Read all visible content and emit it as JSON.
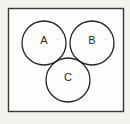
{
  "figure": {
    "kind": "venn-diagram",
    "background_color": "#f3f2ef",
    "frame": {
      "name": "diagram-border-frame",
      "stroke_color": "#3a3a3a",
      "x": 8,
      "y": 8,
      "width": 116,
      "height": 104
    },
    "corner_mark": {
      "name": "scan-artifact-mark",
      "color": "#1d1d1d",
      "x": 0,
      "y": 2,
      "width": 5,
      "height": 5
    },
    "stroke_color": "#262626",
    "stroke_width": 1.3,
    "fill_unshaded": "#fdfdfb",
    "fill_shaded": "#7b7b7b",
    "sets": [
      {
        "id": "A",
        "label": "A",
        "cx": 44,
        "cy": 43,
        "r": 22,
        "label_x": 44,
        "label_y": 41
      },
      {
        "id": "B",
        "label": "B",
        "cx": 92,
        "cy": 43,
        "r": 22,
        "label_x": 92,
        "label_y": 41
      },
      {
        "id": "C",
        "label": "C",
        "cx": 68,
        "cy": 80,
        "r": 22,
        "label_x": 68,
        "label_y": 78
      }
    ],
    "regions": [
      {
        "id": "A_only",
        "sets": [
          "A"
        ],
        "shaded": false
      },
      {
        "id": "B_only",
        "sets": [
          "B"
        ],
        "shaded": false
      },
      {
        "id": "C_only",
        "sets": [
          "C"
        ],
        "shaded": false
      },
      {
        "id": "A_and_B",
        "sets": [
          "A",
          "B"
        ],
        "shaded": true
      },
      {
        "id": "A_and_C",
        "sets": [
          "A",
          "C"
        ],
        "shaded": true
      },
      {
        "id": "B_and_C",
        "sets": [
          "B",
          "C"
        ],
        "shaded": false
      },
      {
        "id": "A_B_C",
        "sets": [
          "A",
          "B",
          "C"
        ],
        "shaded": false
      }
    ],
    "shaded_region_ids": [
      "A_and_B",
      "A_and_C"
    ]
  }
}
